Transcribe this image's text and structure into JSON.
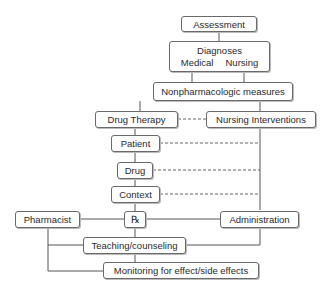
{
  "diagram": {
    "type": "flowchart",
    "nodes": {
      "assessment": "Assessment",
      "diagnoses": {
        "title": "Diagnoses",
        "medical": "Medical",
        "nursing": "Nursing"
      },
      "nonpharm": "Nonpharmacologic measures",
      "drug_therapy": "Drug Therapy",
      "nursing_interventions": "Nursing Interventions",
      "patient": "Patient",
      "drug": "Drug",
      "context": "Context",
      "pharmacist": "Pharmacist",
      "rx": "℞",
      "administration": "Administration",
      "teaching": "Teaching/counseling",
      "monitoring": "Monitoring for effect/side effects"
    },
    "edges": [
      {
        "from": "Assessment",
        "to": "Diagnoses",
        "style": "solid"
      },
      {
        "from": "Diagnoses (Medical)",
        "to": "Nonpharmacologic measures",
        "style": "solid"
      },
      {
        "from": "Diagnoses (Nursing)",
        "to": "Nonpharmacologic measures",
        "style": "solid"
      },
      {
        "from": "Nonpharmacologic measures",
        "to": "Drug Therapy",
        "style": "solid"
      },
      {
        "from": "Nonpharmacologic measures",
        "to": "Nursing Interventions",
        "style": "solid"
      },
      {
        "from": "Drug Therapy",
        "to": "Nursing Interventions",
        "style": "dashed"
      },
      {
        "from": "Drug Therapy",
        "to": "Patient",
        "style": "solid"
      },
      {
        "from": "Patient",
        "to": "Drug",
        "style": "solid"
      },
      {
        "from": "Drug",
        "to": "Context",
        "style": "solid"
      },
      {
        "from": "Patient",
        "to": "Nursing Interventions line",
        "style": "dashed"
      },
      {
        "from": "Drug",
        "to": "Nursing Interventions line",
        "style": "dashed"
      },
      {
        "from": "Context",
        "to": "Nursing Interventions line",
        "style": "dashed"
      },
      {
        "from": "Context",
        "to": "Rx",
        "style": "solid"
      },
      {
        "from": "Pharmacist",
        "to": "Rx",
        "style": "solid"
      },
      {
        "from": "Rx",
        "to": "Administration",
        "style": "solid"
      },
      {
        "from": "Nursing Interventions",
        "to": "Administration",
        "style": "solid"
      },
      {
        "from": "Rx",
        "to": "Teaching/counseling",
        "style": "solid"
      },
      {
        "from": "Administration",
        "to": "Teaching/counseling",
        "style": "solid"
      },
      {
        "from": "Pharmacist",
        "to": "Teaching/counseling",
        "style": "solid"
      },
      {
        "from": "Pharmacist",
        "to": "Monitoring for effect/side effects",
        "style": "solid"
      },
      {
        "from": "Teaching/counseling",
        "to": "Monitoring for effect/side effects",
        "style": "solid"
      }
    ]
  }
}
